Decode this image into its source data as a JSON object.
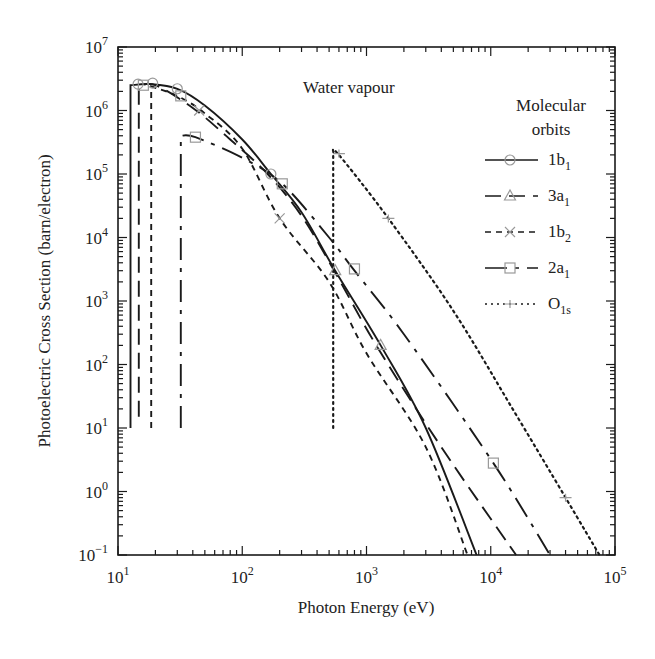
{
  "chart_data": {
    "type": "line",
    "title": "Water vapour",
    "xlabel": "Photon Energy (eV)",
    "ylabel": "Photoelectric Cross Section (barn/electron)",
    "xscale": "log",
    "yscale": "log",
    "xlim": [
      10,
      100000
    ],
    "ylim": [
      0.1,
      10000000
    ],
    "x_tick_labels": [
      "10^1",
      "10^2",
      "10^3",
      "10^4",
      "10^5"
    ],
    "y_tick_labels": [
      "10^-1",
      "10^0",
      "10^1",
      "10^2",
      "10^3",
      "10^4",
      "10^5",
      "10^6",
      "10^7"
    ],
    "grid": false,
    "legend": {
      "title": "Molecular orbits",
      "position": "upper right",
      "entries": [
        "1b1",
        "3a1",
        "1b2",
        "2a1",
        "O1s"
      ]
    },
    "series": [
      {
        "name": "1b1",
        "style": "solid",
        "marker": "circle",
        "threshold_eV": 12.6,
        "points": [
          [
            12.6,
            10
          ],
          [
            12.6,
            2500000
          ],
          [
            18,
            2600000
          ],
          [
            30,
            2200000
          ],
          [
            50,
            1200000
          ],
          [
            100,
            350000
          ],
          [
            170,
            100000
          ],
          [
            300,
            25000
          ],
          [
            560,
            3000
          ],
          [
            1300,
            200
          ],
          [
            3000,
            10
          ],
          [
            7700,
            0.1
          ]
        ]
      },
      {
        "name": "3a1",
        "style": "long-dash",
        "marker": "triangle",
        "threshold_eV": 14.7,
        "points": [
          [
            14.7,
            15
          ],
          [
            14.7,
            2400000
          ],
          [
            20,
            2500000
          ],
          [
            40,
            1100000
          ],
          [
            80,
            350000
          ],
          [
            160,
            100000
          ],
          [
            300,
            22000
          ],
          [
            550,
            3000
          ],
          [
            1200,
            200
          ],
          [
            4000,
            5
          ],
          [
            16000,
            0.1
          ]
        ]
      },
      {
        "name": "1b2",
        "style": "short-dash",
        "marker": "x",
        "threshold_eV": 18.5,
        "points": [
          [
            18.5,
            10
          ],
          [
            18.5,
            2400000
          ],
          [
            30,
            1700000
          ],
          [
            50,
            900000
          ],
          [
            100,
            250000
          ],
          [
            200,
            20000
          ],
          [
            500,
            2000
          ],
          [
            1000,
            150
          ],
          [
            3000,
            5
          ],
          [
            6500,
            0.1
          ]
        ]
      },
      {
        "name": "2a1",
        "style": "long-short-dash",
        "marker": "square",
        "threshold_eV": 32,
        "points": [
          [
            32,
            10
          ],
          [
            32,
            400000
          ],
          [
            42,
            380000
          ],
          [
            100,
            180000
          ],
          [
            210,
            70000
          ],
          [
            500,
            10000
          ],
          [
            800,
            3000
          ],
          [
            2000,
            300
          ],
          [
            10500,
            2.8
          ],
          [
            30000,
            0.1
          ]
        ]
      },
      {
        "name": "O1s",
        "style": "dotted",
        "marker": "plus",
        "threshold_eV": 540,
        "points": [
          [
            540,
            10
          ],
          [
            540,
            220000
          ],
          [
            600,
            200000
          ],
          [
            1500,
            20000
          ],
          [
            5000,
            700
          ],
          [
            15000,
            20
          ],
          [
            40000,
            0.8
          ],
          [
            75000,
            0.1
          ]
        ]
      }
    ]
  },
  "labels": {
    "title": "Water vapour",
    "xlabel": "Photon Energy (eV)",
    "ylabel": "Photoelectric Cross Section (barn/electron)",
    "legend_title_line1": "Molecular",
    "legend_title_line2": "orbits",
    "legend": [
      {
        "base": "1b",
        "sub": "1"
      },
      {
        "base": "3a",
        "sub": "1"
      },
      {
        "base": "1b",
        "sub": "2"
      },
      {
        "base": "2a",
        "sub": "1"
      },
      {
        "base": "O",
        "sub": "1s"
      }
    ],
    "x_ticks": [
      {
        "base": "10",
        "exp": "1"
      },
      {
        "base": "10",
        "exp": "2"
      },
      {
        "base": "10",
        "exp": "3"
      },
      {
        "base": "10",
        "exp": "4"
      },
      {
        "base": "10",
        "exp": "5"
      }
    ],
    "y_ticks": [
      {
        "base": "10",
        "exp": "−1"
      },
      {
        "base": "10",
        "exp": "0"
      },
      {
        "base": "10",
        "exp": "1"
      },
      {
        "base": "10",
        "exp": "2"
      },
      {
        "base": "10",
        "exp": "3"
      },
      {
        "base": "10",
        "exp": "4"
      },
      {
        "base": "10",
        "exp": "5"
      },
      {
        "base": "10",
        "exp": "6"
      },
      {
        "base": "10",
        "exp": "7"
      }
    ]
  },
  "colors": {
    "line": "#1a1a1a",
    "marker": "#999999"
  }
}
